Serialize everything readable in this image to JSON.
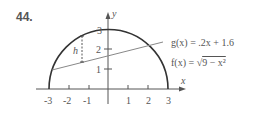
{
  "problem_number": "44.",
  "axes": {
    "x_label": "x",
    "y_label": "y",
    "x_ticks": [
      "-3",
      "-2",
      "-1",
      "1",
      "2",
      "3"
    ],
    "y_ticks": [
      "1",
      "2",
      "3"
    ]
  },
  "functions": {
    "g_label": "g(x) = .2x + 1.6",
    "f_label_prefix": "f(x) = ",
    "f_label_radical": "√",
    "f_label_radicand": "9 − x²"
  },
  "annotations": {
    "h_label": "h"
  },
  "colors": {
    "curve": "#333333",
    "line": "#888888",
    "axis": "#555555",
    "text": "#555555"
  }
}
